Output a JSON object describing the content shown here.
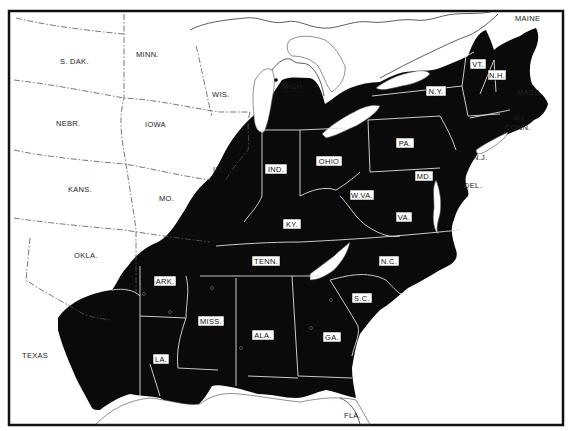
{
  "map": {
    "region": "Eastern United States",
    "shading": "black = shaded range area",
    "unshaded_state_labels": [
      {
        "key": "sdak",
        "text": "S. DAK."
      },
      {
        "key": "minn",
        "text": "MINN."
      },
      {
        "key": "wis",
        "text": "WIS."
      },
      {
        "key": "mich",
        "text": "MICH."
      },
      {
        "key": "nebr",
        "text": "NEBR."
      },
      {
        "key": "iowa",
        "text": "IOWA"
      },
      {
        "key": "ill",
        "text": "ILL."
      },
      {
        "key": "kans",
        "text": "KANS."
      },
      {
        "key": "mo",
        "text": "MO."
      },
      {
        "key": "okla",
        "text": "OKLA."
      },
      {
        "key": "texas",
        "text": "TEXAS"
      },
      {
        "key": "fla",
        "text": "FLA."
      },
      {
        "key": "maine",
        "text": "MAINE"
      },
      {
        "key": "mass",
        "text": "MASS."
      },
      {
        "key": "ri",
        "text": "R.I."
      },
      {
        "key": "conn",
        "text": "CONN."
      },
      {
        "key": "nj",
        "text": "N.J."
      },
      {
        "key": "del",
        "text": "DEL."
      }
    ],
    "boxed_state_labels": [
      {
        "key": "ind",
        "text": "IND."
      },
      {
        "key": "ohio",
        "text": "OHIO"
      },
      {
        "key": "pa",
        "text": "PA."
      },
      {
        "key": "ny",
        "text": "N.Y."
      },
      {
        "key": "vt",
        "text": "VT."
      },
      {
        "key": "nh",
        "text": "N.H."
      },
      {
        "key": "md",
        "text": "MD."
      },
      {
        "key": "wva",
        "text": "W.VA."
      },
      {
        "key": "ky",
        "text": "KY."
      },
      {
        "key": "va",
        "text": "VA."
      },
      {
        "key": "tenn",
        "text": "TENN."
      },
      {
        "key": "nc",
        "text": "N.C."
      },
      {
        "key": "ark",
        "text": "ARK."
      },
      {
        "key": "sc",
        "text": "S.C."
      },
      {
        "key": "miss",
        "text": "MISS."
      },
      {
        "key": "ala",
        "text": "ALA."
      },
      {
        "key": "ga",
        "text": "GA."
      },
      {
        "key": "la",
        "text": "LA."
      }
    ],
    "labels": {
      "sdak": "S. DAK.",
      "minn": "MINN.",
      "wis": "WIS.",
      "mich": "MICH.",
      "nebr": "NEBR.",
      "iowa": "IOWA",
      "ill": "ILL.",
      "kans": "KANS.",
      "mo": "MO.",
      "okla": "OKLA.",
      "texas": "TEXAS",
      "fla": "FLA.",
      "maine": "MAINE",
      "mass": "MASS.",
      "ri": "R.I.",
      "conn": "CONN.",
      "nj": "N.J.",
      "del": "DEL.",
      "ind": "IND.",
      "ohio": "OHIO",
      "pa": "PA.",
      "ny": "N.Y.",
      "vt": "VT.",
      "nh": "N.H.",
      "md": "MD.",
      "wva": "W.VA.",
      "ky": "KY.",
      "va": "VA.",
      "tenn": "TENN.",
      "nc": "N.C.",
      "ark": "ARK.",
      "sc": "S.C.",
      "miss": "MISS.",
      "ala": "ALA.",
      "ga": "GA.",
      "la": "LA."
    },
    "colors": {
      "shaded": "#0a0a0a",
      "background": "#ffffff",
      "label_box": "#ffffff"
    }
  }
}
